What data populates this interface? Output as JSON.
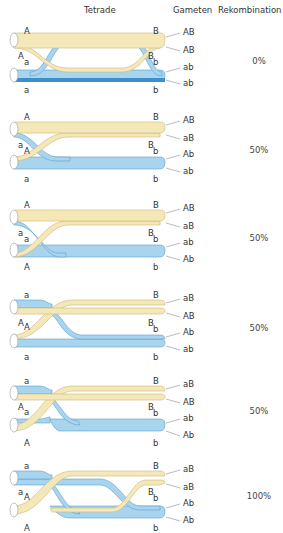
{
  "header": {
    "tetrade": "Tetrade",
    "gameten": "Gameten",
    "rekombination": "Rekombination"
  },
  "colors": {
    "yellow_fill": "#f5e8b8",
    "yellow_stroke": "#c9b77a",
    "blue_fill": "#a9d4ee",
    "blue_dark": "#3d8fcc",
    "blue_stroke": "#5a9fcf"
  },
  "panels": [
    {
      "top_left": "A",
      "top_left2": "A",
      "mid_left": "a",
      "bottom_left": "a",
      "top_right": "B",
      "mid_right1": "B",
      "mid_right2": "b",
      "bottom_right": "b",
      "gametes": [
        "AB",
        "AB",
        "ab",
        "ab"
      ],
      "recombination": "0%"
    },
    {
      "top_left": "A",
      "top_left2": "a",
      "mid_left": "A",
      "bottom_left": "a",
      "top_right": "B",
      "mid_right1": "B",
      "mid_right2": "b",
      "bottom_right": "b",
      "gametes": [
        "AB",
        "aB",
        "Ab",
        "ab"
      ],
      "recombination": "50%"
    },
    {
      "top_left": "A",
      "top_left2": "a",
      "mid_left": "a",
      "bottom_left": "A",
      "top_right": "B",
      "mid_right1": "B",
      "mid_right2": "b",
      "bottom_right": "b",
      "gametes": [
        "AB",
        "aB",
        "ab",
        "Ab"
      ],
      "recombination": "50%"
    },
    {
      "top_left": "a",
      "top_left2": "A",
      "mid_left": "A",
      "bottom_left": "a",
      "top_right": "B",
      "mid_right1": "B",
      "mid_right2": "b",
      "bottom_right": "b",
      "gametes": [
        "aB",
        "AB",
        "Ab",
        "ab"
      ],
      "recombination": "50%"
    },
    {
      "top_left": "a",
      "top_left2": "A",
      "mid_left": "a",
      "bottom_left": "A",
      "top_right": "B",
      "mid_right1": "B",
      "mid_right2": "b",
      "bottom_right": "b",
      "gametes": [
        "aB",
        "AB",
        "ab",
        "Ab"
      ],
      "recombination": "50%"
    },
    {
      "top_left": "a",
      "top_left2": "a",
      "mid_left": "A",
      "bottom_left": "A",
      "top_right": "B",
      "mid_right1": "B",
      "mid_right2": "b",
      "bottom_right": "b",
      "gametes": [
        "aB",
        "aB",
        "Ab",
        "Ab"
      ],
      "recombination": "100%"
    }
  ]
}
